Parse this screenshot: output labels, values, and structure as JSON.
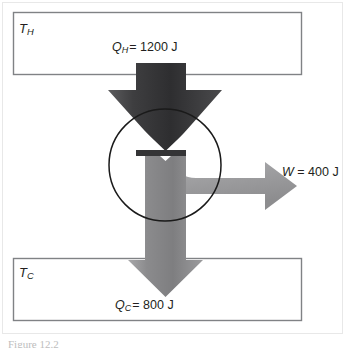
{
  "figure": {
    "type": "heat-engine-energy-flow-diagram",
    "background_color": "#ffffff",
    "caption_partial": "Figure 12.2"
  },
  "reservoirs": {
    "hot": {
      "label_symbol": "T",
      "label_subscript": "H",
      "name": "hot-reservoir",
      "border_color": "#808285",
      "fill_color": "#ffffff"
    },
    "cold": {
      "label_symbol": "T",
      "label_subscript": "C",
      "name": "cold-reservoir",
      "border_color": "#808285",
      "fill_color": "#ffffff"
    }
  },
  "flows": {
    "heat_in": {
      "symbol": "Q",
      "subscript": "H",
      "equals": "=",
      "value": "1200",
      "unit": "J",
      "full_text": "1200 J",
      "arrow_color_dark": "#3b3b3d",
      "direction": "down"
    },
    "work_out": {
      "symbol": "W",
      "subscript": "",
      "equals": "=",
      "value": "400",
      "unit": "J",
      "full_text": "400 J",
      "arrow_color": "#9a9a9c",
      "direction": "right"
    },
    "heat_out": {
      "symbol": "Q",
      "subscript": "C",
      "equals": "=",
      "value": "800",
      "unit": "J",
      "full_text": "800 J",
      "arrow_color": "#8d8d8f",
      "direction": "down"
    }
  },
  "engine": {
    "name": "engine-circle",
    "stroke_color": "#1a1a1a",
    "fill": "none",
    "center_x": 165,
    "center_y": 165,
    "radius": 56
  },
  "colors": {
    "text": "#231f20",
    "box_border": "#808285",
    "dark_arrow": "#3b3b3d",
    "light_arrow": "#9a9a9c",
    "mid_arrow": "#7f7f81"
  }
}
